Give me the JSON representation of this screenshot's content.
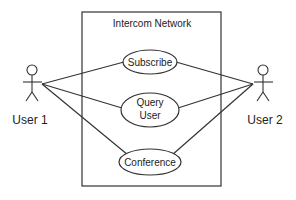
{
  "diagram": {
    "type": "uml-use-case",
    "system": {
      "title": "Intercom Network"
    },
    "actors": [
      {
        "id": "user1",
        "label": "User 1"
      },
      {
        "id": "user2",
        "label": "User 2"
      }
    ],
    "use_cases": [
      {
        "id": "subscribe",
        "lines": [
          "Subscribe"
        ]
      },
      {
        "id": "query",
        "lines": [
          "Query",
          "User"
        ]
      },
      {
        "id": "conference",
        "lines": [
          "Conference"
        ]
      }
    ],
    "associations": [
      [
        "user1",
        "subscribe"
      ],
      [
        "user1",
        "query"
      ],
      [
        "user1",
        "conference"
      ],
      [
        "user2",
        "subscribe"
      ],
      [
        "user2",
        "query"
      ],
      [
        "user2",
        "conference"
      ]
    ],
    "colors": {
      "stroke": "#333333",
      "background": "#ffffff"
    }
  }
}
